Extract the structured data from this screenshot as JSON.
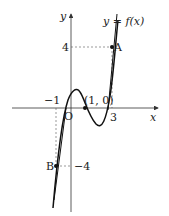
{
  "figure": {
    "curve_label": "y = f(x)",
    "axis_x_label": "x",
    "axis_y_label": "y",
    "origin_label": "O",
    "point_a_label": "A",
    "point_b_label": "B",
    "point_c_label": "(1, 0)",
    "tick_x_neg1": "−1",
    "tick_x_3": "3",
    "tick_y_4": "4",
    "tick_y_neg4": "−4"
  },
  "points": {
    "A": [
      3,
      4
    ],
    "B": [
      -1,
      -4
    ],
    "C": [
      1,
      0
    ]
  },
  "colors": {
    "curve": "#111111",
    "axis": "#333333",
    "guide": "#555555"
  }
}
